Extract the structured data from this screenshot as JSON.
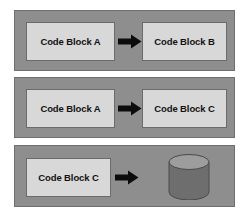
{
  "diagram": {
    "type": "flow-diagram",
    "background_color": "#ffffff",
    "panel_color": "#8e8e8e",
    "panel_border_color": "#6f6f6f",
    "box_color": "#d8d8d8",
    "box_border_color": "#6b6b6b",
    "arrow_color": "#0c0c0c",
    "cylinder_color": "#6e6e6e",
    "cylinder_top_color": "#9a9a9a",
    "text_color": "#121212",
    "panels": [
      {
        "id": "panel-1",
        "source_label": "Code Block A",
        "arrow_icon": "right-block-arrow-icon",
        "target_label": "Code Block B",
        "target_type": "code-block"
      },
      {
        "id": "panel-2",
        "source_label": "Code Block A",
        "arrow_icon": "right-block-arrow-icon",
        "target_label": "Code Block C",
        "target_type": "code-block"
      },
      {
        "id": "panel-3",
        "source_label": "Code Block C",
        "arrow_icon": "right-block-arrow-icon",
        "target_label": "",
        "target_type": "database-cylinder",
        "target_icon": "database-cylinder-icon"
      }
    ]
  }
}
